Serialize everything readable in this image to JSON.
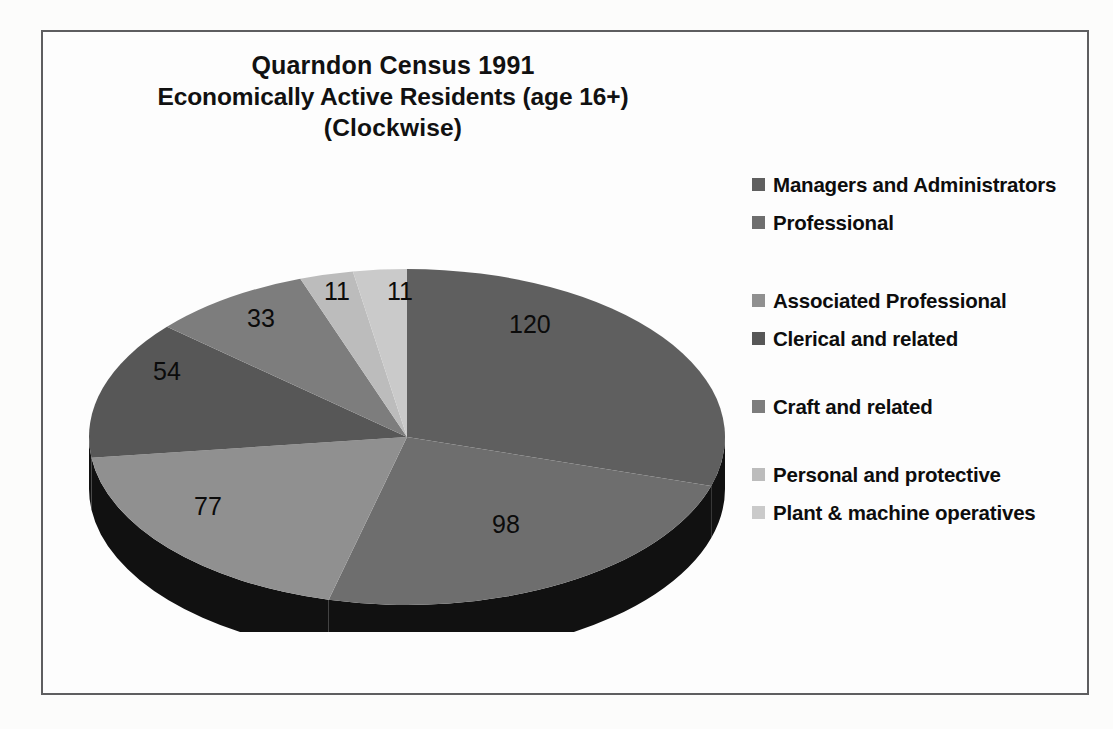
{
  "chart_data": {
    "type": "pie",
    "title": "Quarndon Census 1991 Economically Active Residents (age 16+) (Clockwise)",
    "title_lines": [
      "Quarndon Census 1991",
      "Economically Active Residents (age 16+)",
      "(Clockwise)"
    ],
    "categories": [
      "Managers and Administrators",
      "Professional",
      "Associated Professional",
      "Clerical and related",
      "Craft and related",
      "Personal and protective",
      "Plant & machine operatives"
    ],
    "values": [
      120,
      98,
      77,
      54,
      33,
      11,
      11
    ],
    "value_labels": [
      "120",
      "98",
      "77",
      "54",
      "33",
      "11",
      "11"
    ],
    "total": 404,
    "xlabel": "",
    "ylabel": "",
    "legend_position": "right",
    "grid": false,
    "start_angle_deg": 0,
    "direction": "clockwise",
    "three_d": true,
    "colors": [
      "#5f5f5f",
      "#6e6e6e",
      "#909090",
      "#575757",
      "#7d7d7d",
      "#bcbcbc",
      "#cacaca"
    ],
    "side_color": "#111111"
  },
  "chart": {
    "title_line_1": "Quarndon Census 1991",
    "title_line_2": "Economically Active Residents (age 16+)",
    "title_line_3": "(Clockwise)",
    "border_color": "#5e5e60",
    "background_color": "#fdfdfd"
  },
  "legend": {
    "items": [
      {
        "label": "Managers and Administrators",
        "color": "#5f5f5f",
        "value": 120
      },
      {
        "label": "Professional",
        "color": "#6e6e6e",
        "value": 98
      },
      {
        "label": "Associated Professional",
        "color": "#909090",
        "value": 77
      },
      {
        "label": "Clerical and related",
        "color": "#575757",
        "value": 54
      },
      {
        "label": "Craft and related",
        "color": "#7d7d7d",
        "value": 33
      },
      {
        "label": "Personal and protective",
        "color": "#bcbcbc",
        "value": 11
      },
      {
        "label": "Plant & machine operatives",
        "color": "#cacaca",
        "value": 11
      }
    ]
  },
  "slice_labels": {
    "l0": "120",
    "l1": "98",
    "l2": "77",
    "l3": "54",
    "l4": "33",
    "l5": "11",
    "l6": "11"
  }
}
